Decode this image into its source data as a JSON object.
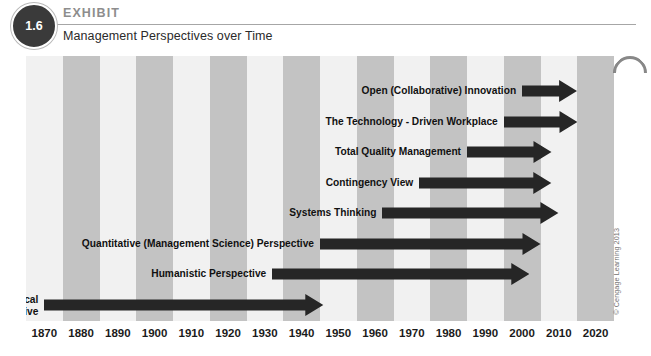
{
  "header": {
    "badge_number": "1.6",
    "kicker": "EXHIBIT",
    "title": "Management Perspectives over Time"
  },
  "copyright": "© Cengage Learning 2013",
  "colors": {
    "band_light": "#f1f1f1",
    "band_dark": "#c3c3c3",
    "arrow": "#262626",
    "badge": "#3a3a3a",
    "kicker_gray": "#8d8d8d",
    "rule": "#a6a6a6",
    "text": "#111111"
  },
  "chart_data": {
    "type": "bar",
    "title": "Management Perspectives over Time",
    "xlabel": "",
    "ylabel": "",
    "grid": false,
    "legend": "none",
    "xlim": [
      1870,
      2020
    ],
    "tick_step": 10,
    "tick_labels": [
      "1870",
      "1880",
      "1890",
      "1900",
      "1910",
      "1920",
      "1930",
      "1940",
      "1950",
      "1960",
      "1970",
      "1980",
      "1990",
      "2000",
      "2010",
      "2020"
    ],
    "categories": [
      "Open (Collaborative) Innovation",
      "The Technology - Driven Workplace",
      "Total Quality Management",
      "Contingency View",
      "Systems Thinking",
      "Quantitative (Management Science) Perspective",
      "Humanistic Perspective",
      "Classical Perspective"
    ],
    "series": [
      {
        "name": "Management perspective era",
        "bars": [
          {
            "label": "Open (Collaborative) Innovation",
            "label_line2": "",
            "start_year": 2000,
            "end_year": 2015,
            "row": 0
          },
          {
            "label": "The Technology - Driven Workplace",
            "label_line2": "",
            "start_year": 1995,
            "end_year": 2015,
            "row": 1
          },
          {
            "label": "Total Quality Management",
            "label_line2": "",
            "start_year": 1985,
            "end_year": 2008,
            "row": 2
          },
          {
            "label": "Contingency View",
            "label_line2": "",
            "start_year": 1972,
            "end_year": 2008,
            "row": 3
          },
          {
            "label": "Systems Thinking",
            "label_line2": "",
            "start_year": 1962,
            "end_year": 2010,
            "row": 4
          },
          {
            "label": "Quantitative (Management Science) Perspective",
            "label_line2": "",
            "start_year": 1945,
            "end_year": 2005,
            "row": 5
          },
          {
            "label": "Humanistic Perspective",
            "label_line2": "",
            "start_year": 1932,
            "end_year": 2002,
            "row": 6
          },
          {
            "label": "Classical",
            "label_line2": "Perspective",
            "start_year": 1870,
            "end_year": 1946,
            "row": 7
          }
        ]
      }
    ]
  }
}
